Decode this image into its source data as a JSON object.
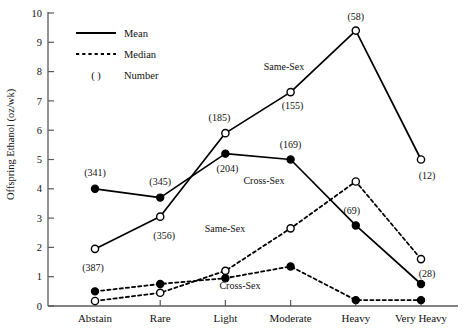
{
  "chart_data": {
    "type": "line",
    "title": "",
    "xlabel": "",
    "ylabel": "Offspring Ethanol (oz/wk)",
    "categories": [
      "Abstain",
      "Rare",
      "Light",
      "Moderate",
      "Heavy",
      "Very Heavy"
    ],
    "ylim": [
      0,
      10
    ],
    "yticks": [
      0,
      1,
      2,
      3,
      4,
      5,
      6,
      7,
      8,
      9,
      10
    ],
    "ytick_labels": [
      "0",
      "1",
      "2",
      "3",
      "4",
      "5",
      "6",
      "7",
      "8",
      "9",
      "10"
    ],
    "grid": false,
    "legend_position": "top-left",
    "legend": [
      {
        "label": "Mean",
        "style": "solid-line"
      },
      {
        "label": "Median",
        "style": "dotted-line"
      },
      {
        "label": "Number",
        "style": "parenthesis",
        "prefix": "( )"
      }
    ],
    "marker_key": {
      "filled_circle": "Cross-Sex",
      "open_circle": "Same-Sex"
    },
    "series": [
      {
        "name": "Cross-Sex Mean",
        "statistic": "Mean",
        "group": "Cross-Sex",
        "marker": "filled-circle",
        "line": "solid",
        "values": [
          4.0,
          3.7,
          5.2,
          5.0,
          2.75,
          0.75
        ],
        "counts": [
          341,
          345,
          204,
          169,
          69,
          null
        ],
        "count_labels": [
          "(341)",
          "(345)",
          "(204)",
          "(169)",
          "(69)",
          ""
        ]
      },
      {
        "name": "Same-Sex Mean",
        "statistic": "Mean",
        "group": "Same-Sex",
        "marker": "open-circle",
        "line": "solid",
        "values": [
          1.95,
          3.05,
          5.9,
          7.3,
          9.4,
          5.0
        ],
        "counts": [
          387,
          356,
          185,
          155,
          58,
          12
        ],
        "count_labels": [
          "(387)",
          "(356)",
          "(185)",
          "(155)",
          "(58)",
          "(12)"
        ]
      },
      {
        "name": "Cross-Sex Median",
        "statistic": "Median",
        "group": "Cross-Sex",
        "marker": "filled-circle",
        "line": "dotted",
        "values": [
          0.5,
          0.75,
          0.95,
          1.35,
          0.2,
          0.2
        ],
        "counts": [
          null,
          null,
          null,
          null,
          null,
          null
        ],
        "count_labels": [
          "",
          "",
          "",
          "",
          "",
          ""
        ]
      },
      {
        "name": "Same-Sex Median",
        "statistic": "Median",
        "group": "Same-Sex",
        "marker": "open-circle",
        "line": "dotted",
        "values": [
          0.17,
          0.45,
          1.2,
          2.65,
          4.25,
          1.6
        ],
        "counts": [
          null,
          null,
          null,
          null,
          null,
          28
        ],
        "count_labels": [
          "",
          "",
          "",
          "",
          "",
          "(28)"
        ]
      }
    ],
    "annotations": [
      {
        "text": "Same-Sex",
        "x": 284,
        "y": 70,
        "ref": "same-sex-mean"
      },
      {
        "text": "Cross-Sex",
        "x": 264,
        "y": 184,
        "ref": "cross-sex-mean"
      },
      {
        "text": "Same-Sex",
        "x": 225,
        "y": 232,
        "ref": "same-sex-median"
      },
      {
        "text": "Cross-Sex",
        "x": 240,
        "y": 289,
        "ref": "cross-sex-median"
      }
    ]
  }
}
